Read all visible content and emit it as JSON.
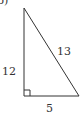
{
  "problem_label": "b)",
  "triangle": {
    "type": "right-triangle",
    "sides": {
      "vertical_leg": "12",
      "hypotenuse": "13",
      "horizontal_leg": "5"
    },
    "right_angle_marker": true
  },
  "colors": {
    "stroke": "#333333",
    "background": "#ffffff"
  }
}
